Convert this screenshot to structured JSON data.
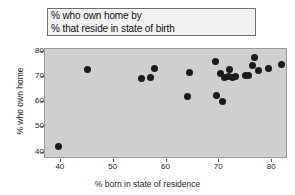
{
  "figure": {
    "background_color": "#ffffff",
    "plot_background_color": "#cfcfcf",
    "marker_color": "#1b1b1b",
    "title_box_background": "#f2f2f2",
    "title_box_border": "#6e6e6e"
  },
  "title": {
    "line1": "% who own home by",
    "line2": "% that reside in state of birth"
  },
  "chart_data": {
    "type": "scatter",
    "title": "% who own home by % that reside in state of birth",
    "xlabel": "% born in state of residence",
    "ylabel": "% who own home",
    "xlim": [
      37,
      83
    ],
    "ylim": [
      37.5,
      81
    ],
    "xticks": [
      40,
      50,
      60,
      70,
      80
    ],
    "yticks": [
      40,
      50,
      60,
      70,
      80
    ],
    "xtick_labels": [
      "40",
      "50",
      "60",
      "70",
      "80"
    ],
    "ytick_labels": [
      "40",
      "50",
      "60",
      "70",
      "80"
    ],
    "grid": false,
    "legend": false,
    "marker": "circle",
    "points": [
      {
        "x": 39.5,
        "y": 42.4
      },
      {
        "x": 45.0,
        "y": 72.7
      },
      {
        "x": 55.3,
        "y": 69.2
      },
      {
        "x": 56.9,
        "y": 69.8
      },
      {
        "x": 57.7,
        "y": 73.3
      },
      {
        "x": 63.9,
        "y": 62.2
      },
      {
        "x": 64.3,
        "y": 71.9
      },
      {
        "x": 69.3,
        "y": 76.0
      },
      {
        "x": 69.4,
        "y": 62.8
      },
      {
        "x": 70.2,
        "y": 71.2
      },
      {
        "x": 70.6,
        "y": 60.1
      },
      {
        "x": 71.0,
        "y": 69.6
      },
      {
        "x": 71.8,
        "y": 70.0
      },
      {
        "x": 72.0,
        "y": 73.0
      },
      {
        "x": 72.5,
        "y": 69.9
      },
      {
        "x": 73.0,
        "y": 70.1
      },
      {
        "x": 74.9,
        "y": 70.4
      },
      {
        "x": 75.6,
        "y": 70.6
      },
      {
        "x": 76.2,
        "y": 74.5
      },
      {
        "x": 76.7,
        "y": 77.5
      },
      {
        "x": 77.4,
        "y": 72.5
      },
      {
        "x": 79.3,
        "y": 73.4
      },
      {
        "x": 81.7,
        "y": 74.7
      }
    ]
  }
}
